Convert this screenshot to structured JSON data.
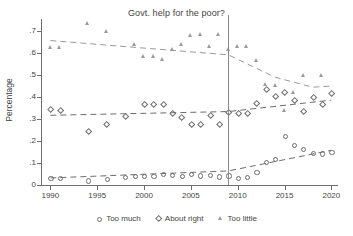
{
  "chart_data": {
    "type": "scatter",
    "title": "Govt. help for the poor?",
    "xlabel": "",
    "ylabel": "Percentage",
    "xlim": [
      1989,
      2020.6
    ],
    "ylim": [
      0,
      0.755
    ],
    "grid": false,
    "legend_position": "bottom",
    "xticks": [
      1990,
      1995,
      2000,
      2005,
      2010,
      2015,
      2020
    ],
    "xtick_labels": [
      "1990",
      "1995",
      "2000",
      "2005",
      "2010",
      "2015",
      "2020"
    ],
    "yticks": [
      0,
      0.1,
      0.2,
      0.3,
      0.4,
      0.5,
      0.6,
      0.7
    ],
    "ytick_labels": [
      "0",
      ".1",
      ".2",
      ".3",
      ".4",
      ".5",
      ".6",
      ".7"
    ],
    "annotations": [
      {
        "name": "vertical-reference-line",
        "type": "vline",
        "x": 2009,
        "color": "#8a8a8a"
      }
    ],
    "series": [
      {
        "name": "Too much",
        "marker": "circle",
        "color": "#6d6d6d",
        "points": [
          {
            "x": 1990,
            "y": 0.031
          },
          {
            "x": 1991,
            "y": 0.033
          },
          {
            "x": 1994,
            "y": 0.021
          },
          {
            "x": 1996,
            "y": 0.027
          },
          {
            "x": 1998,
            "y": 0.038
          },
          {
            "x": 1999,
            "y": 0.04
          },
          {
            "x": 2000,
            "y": 0.043
          },
          {
            "x": 2001,
            "y": 0.041
          },
          {
            "x": 2002,
            "y": 0.051
          },
          {
            "x": 2003,
            "y": 0.045
          },
          {
            "x": 2004,
            "y": 0.043
          },
          {
            "x": 2005,
            "y": 0.049
          },
          {
            "x": 2006,
            "y": 0.044
          },
          {
            "x": 2007,
            "y": 0.047
          },
          {
            "x": 2008,
            "y": 0.039
          },
          {
            "x": 2009,
            "y": 0.044
          },
          {
            "x": 2010,
            "y": 0.033
          },
          {
            "x": 2011,
            "y": 0.037
          },
          {
            "x": 2012,
            "y": 0.058
          },
          {
            "x": 2013,
            "y": 0.106
          },
          {
            "x": 2014,
            "y": 0.12
          },
          {
            "x": 2015,
            "y": 0.224
          },
          {
            "x": 2016,
            "y": 0.183
          },
          {
            "x": 2017,
            "y": 0.165
          },
          {
            "x": 2018,
            "y": 0.146
          },
          {
            "x": 2019,
            "y": 0.144
          },
          {
            "x": 2020,
            "y": 0.149
          }
        ],
        "fit": [
          {
            "x": 1990,
            "y": 0.032
          },
          {
            "x": 2009,
            "y": 0.064
          },
          {
            "x": 2020,
            "y": 0.158
          }
        ]
      },
      {
        "name": "About right",
        "marker": "diamond",
        "color": "#6d6d6d",
        "points": [
          {
            "x": 1990,
            "y": 0.344
          },
          {
            "x": 1991,
            "y": 0.342
          },
          {
            "x": 1994,
            "y": 0.244
          },
          {
            "x": 1996,
            "y": 0.277
          },
          {
            "x": 1998,
            "y": 0.315
          },
          {
            "x": 2000,
            "y": 0.368
          },
          {
            "x": 2001,
            "y": 0.366
          },
          {
            "x": 2002,
            "y": 0.366
          },
          {
            "x": 2003,
            "y": 0.326
          },
          {
            "x": 2004,
            "y": 0.311
          },
          {
            "x": 2005,
            "y": 0.275
          },
          {
            "x": 2006,
            "y": 0.276
          },
          {
            "x": 2007,
            "y": 0.32
          },
          {
            "x": 2008,
            "y": 0.275
          },
          {
            "x": 2009,
            "y": 0.333
          },
          {
            "x": 2010,
            "y": 0.327
          },
          {
            "x": 2011,
            "y": 0.329
          },
          {
            "x": 2012,
            "y": 0.374
          },
          {
            "x": 2013,
            "y": 0.436
          },
          {
            "x": 2014,
            "y": 0.404
          },
          {
            "x": 2015,
            "y": 0.424
          },
          {
            "x": 2016,
            "y": 0.386
          },
          {
            "x": 2017,
            "y": 0.337
          },
          {
            "x": 2018,
            "y": 0.401
          },
          {
            "x": 2019,
            "y": 0.366
          },
          {
            "x": 2020,
            "y": 0.417
          }
        ],
        "fit": [
          {
            "x": 1990,
            "y": 0.317
          },
          {
            "x": 2009,
            "y": 0.334
          },
          {
            "x": 2020,
            "y": 0.386
          }
        ]
      },
      {
        "name": "Too little",
        "marker": "triangle",
        "color": "#9a9a9a",
        "points": [
          {
            "x": 1990,
            "y": 0.623
          },
          {
            "x": 1991,
            "y": 0.622
          },
          {
            "x": 1994,
            "y": 0.734
          },
          {
            "x": 1996,
            "y": 0.695
          },
          {
            "x": 1999,
            "y": 0.639
          },
          {
            "x": 2000,
            "y": 0.581
          },
          {
            "x": 2001,
            "y": 0.583
          },
          {
            "x": 2002,
            "y": 0.569
          },
          {
            "x": 2003,
            "y": 0.613
          },
          {
            "x": 2004,
            "y": 0.637
          },
          {
            "x": 2005,
            "y": 0.679
          },
          {
            "x": 2006,
            "y": 0.684
          },
          {
            "x": 2007,
            "y": 0.629
          },
          {
            "x": 2008,
            "y": 0.683
          },
          {
            "x": 2009,
            "y": 0.613
          },
          {
            "x": 2010,
            "y": 0.629
          },
          {
            "x": 2011,
            "y": 0.627
          },
          {
            "x": 2012,
            "y": 0.563
          },
          {
            "x": 2013,
            "y": 0.455
          },
          {
            "x": 2014,
            "y": 0.448
          },
          {
            "x": 2015,
            "y": 0.338
          },
          {
            "x": 2016,
            "y": 0.419
          },
          {
            "x": 2017,
            "y": 0.497
          },
          {
            "x": 2019,
            "y": 0.496
          }
        ],
        "fit": [
          {
            "x": 1990,
            "y": 0.657
          },
          {
            "x": 2009,
            "y": 0.592
          },
          {
            "x": 2014,
            "y": 0.49
          },
          {
            "x": 2018,
            "y": 0.445
          },
          {
            "x": 2020,
            "y": 0.45
          }
        ]
      }
    ]
  },
  "legend": {
    "items": [
      {
        "label": "Too much",
        "marker": "circle"
      },
      {
        "label": "About right",
        "marker": "diamond"
      },
      {
        "label": "Too little",
        "marker": "triangle"
      }
    ]
  }
}
